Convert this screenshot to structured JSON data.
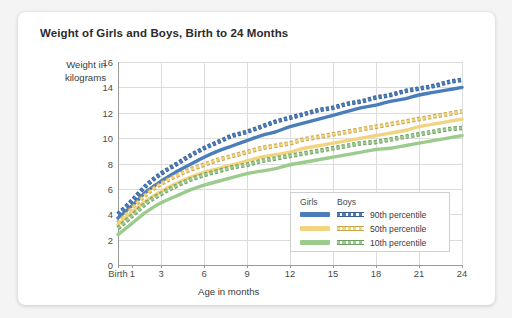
{
  "card": {
    "title": "Weight of Girls and Boys, Birth to 24 Months"
  },
  "axes": {
    "ylabel_line1": "Weight in",
    "ylabel_line2": "kilograms",
    "xlabel": "Age in months",
    "yticks": [
      "0",
      "2",
      "4",
      "6",
      "8",
      "10",
      "12",
      "14",
      "16"
    ],
    "xticks": [
      "Birth",
      "1",
      "3",
      "6",
      "9",
      "12",
      "15",
      "18",
      "21",
      "24"
    ]
  },
  "legend": {
    "col1": "Girls",
    "col2": "Boys",
    "rows": [
      {
        "label": "90th percentile",
        "color": "#4a7ebb"
      },
      {
        "label": "50th percentile",
        "color": "#f0d480"
      },
      {
        "label": "10th percentile",
        "color": "#9ccb8e"
      }
    ]
  },
  "colors": {
    "blue": "#4a7ebb",
    "blue_dark": "#3c5e92",
    "yellow": "#f0d480",
    "yellow_dark": "#c9a44a",
    "green": "#9ccb8e",
    "green_dark": "#6f9e63",
    "grid": "#dcdcdc",
    "axis": "#9a9a9a",
    "card_bg": "#ffffff",
    "page_bg": "#f4f4f4"
  },
  "chart_data": {
    "type": "line",
    "title": "Weight of Girls and Boys, Birth to 24 Months",
    "xlabel": "Age in months",
    "ylabel": "Weight in kilograms",
    "xlim": [
      0,
      24
    ],
    "ylim": [
      0,
      16
    ],
    "xticks": [
      0,
      1,
      3,
      6,
      9,
      12,
      15,
      18,
      21,
      24
    ],
    "xtick_labels": [
      "Birth",
      "1",
      "3",
      "6",
      "9",
      "12",
      "15",
      "18",
      "21",
      "24"
    ],
    "yticks": [
      0,
      2,
      4,
      6,
      8,
      10,
      12,
      14,
      16
    ],
    "grid": true,
    "legend_position": "inside-bottom-right",
    "x": [
      0,
      1,
      2,
      3,
      4,
      5,
      6,
      7,
      8,
      9,
      10,
      11,
      12,
      13,
      14,
      15,
      16,
      17,
      18,
      19,
      20,
      21,
      22,
      23,
      24
    ],
    "series": [
      {
        "name": "Boys 90th percentile",
        "sex": "Boys",
        "percentile": 90,
        "style": "dashed",
        "color": "#4a7ebb",
        "values": [
          4.0,
          5.1,
          6.3,
          7.2,
          7.9,
          8.6,
          9.2,
          9.7,
          10.2,
          10.5,
          10.9,
          11.3,
          11.6,
          11.9,
          12.2,
          12.4,
          12.7,
          12.9,
          13.2,
          13.4,
          13.7,
          13.9,
          14.1,
          14.4,
          14.6
        ]
      },
      {
        "name": "Girls 90th percentile",
        "sex": "Girls",
        "percentile": 90,
        "style": "solid",
        "color": "#4a7ebb",
        "values": [
          3.7,
          4.7,
          5.8,
          6.6,
          7.3,
          7.9,
          8.5,
          9.0,
          9.4,
          9.8,
          10.2,
          10.5,
          10.9,
          11.2,
          11.5,
          11.8,
          12.1,
          12.4,
          12.6,
          12.9,
          13.1,
          13.4,
          13.6,
          13.8,
          14.0
        ]
      },
      {
        "name": "Boys 50th percentile",
        "sex": "Boys",
        "percentile": 50,
        "style": "dashed",
        "color": "#f0d480",
        "values": [
          3.3,
          4.5,
          5.6,
          6.4,
          7.0,
          7.5,
          7.9,
          8.3,
          8.6,
          8.9,
          9.2,
          9.4,
          9.6,
          9.9,
          10.1,
          10.3,
          10.5,
          10.7,
          10.9,
          11.1,
          11.3,
          11.5,
          11.7,
          11.9,
          12.1
        ]
      },
      {
        "name": "Girls 50th percentile",
        "sex": "Girls",
        "percentile": 50,
        "style": "solid",
        "color": "#f0d480",
        "values": [
          3.2,
          4.2,
          5.1,
          5.8,
          6.4,
          6.9,
          7.3,
          7.6,
          7.9,
          8.2,
          8.5,
          8.7,
          8.9,
          9.2,
          9.4,
          9.6,
          9.8,
          10.0,
          10.2,
          10.4,
          10.6,
          10.9,
          11.1,
          11.3,
          11.5
        ]
      },
      {
        "name": "Boys 10th percentile",
        "sex": "Boys",
        "percentile": 10,
        "style": "dashed",
        "color": "#9ccb8e",
        "values": [
          2.9,
          3.9,
          4.9,
          5.6,
          6.2,
          6.7,
          7.1,
          7.4,
          7.7,
          7.9,
          8.2,
          8.4,
          8.6,
          8.8,
          9.0,
          9.2,
          9.4,
          9.6,
          9.7,
          9.9,
          10.1,
          10.3,
          10.5,
          10.7,
          10.8
        ]
      },
      {
        "name": "Girls 10th percentile",
        "sex": "Girls",
        "percentile": 10,
        "style": "solid",
        "color": "#9ccb8e",
        "values": [
          2.4,
          3.3,
          4.2,
          4.9,
          5.4,
          5.9,
          6.3,
          6.6,
          6.9,
          7.2,
          7.4,
          7.6,
          7.9,
          8.1,
          8.3,
          8.5,
          8.7,
          8.9,
          9.1,
          9.2,
          9.4,
          9.6,
          9.8,
          10.0,
          10.2
        ]
      }
    ]
  }
}
